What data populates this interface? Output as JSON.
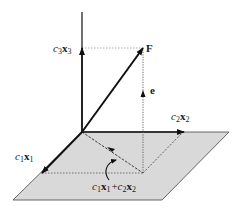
{
  "diagram": {
    "type": "vector-decomposition-3d",
    "colors": {
      "plane_fill": "#d9d9d9",
      "plane_stroke": "#333333",
      "vector": "#111111",
      "dotted": "#666666",
      "background": "#ffffff"
    },
    "labels": {
      "c3x3": {
        "coef": "c",
        "sub1": "3",
        "vec": "x",
        "sub2": "3"
      },
      "F": "F",
      "e": "e",
      "c2x2": {
        "coef": "c",
        "sub1": "2",
        "vec": "x",
        "sub2": "2"
      },
      "c1x1": {
        "coef": "c",
        "sub1": "1",
        "vec": "x",
        "sub2": "1"
      },
      "sum": {
        "t1_coef": "c",
        "t1_sub1": "1",
        "t1_vec": "x",
        "t1_sub2": "1",
        "plus": "+",
        "t2_coef": "c",
        "t2_sub1": "2",
        "t2_vec": "x",
        "t2_sub2": "2"
      }
    },
    "elements": [
      "plane",
      "vertical-axis",
      "c3x3-vector",
      "F-vector",
      "c2x2-vector",
      "c1x1-vector",
      "e-vector-dotted",
      "projection-dashed",
      "curved-pointer-arrow"
    ]
  }
}
